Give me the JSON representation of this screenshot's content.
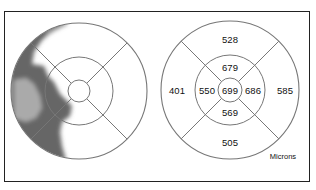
{
  "figure": {
    "left_map": {
      "type": "thickness-colormap",
      "shading": "dark region on left/temporal side, light elsewhere"
    },
    "right_map": {
      "units_label": "Microns",
      "sectors": {
        "center": "699",
        "inner_superior": "679",
        "inner_inferior": "569",
        "inner_temporal": "550",
        "inner_nasal": "686",
        "outer_superior": "528",
        "outer_inferior": "505",
        "outer_temporal": "401",
        "outer_nasal": "585"
      }
    }
  }
}
